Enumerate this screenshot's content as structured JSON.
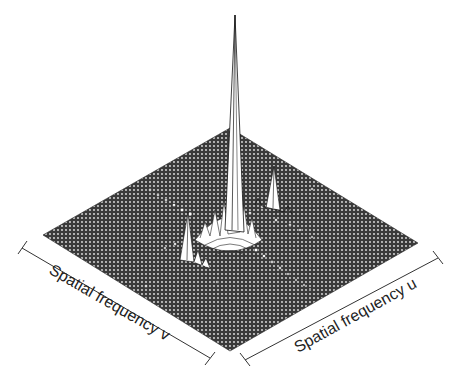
{
  "figure": {
    "type": "3D surface plot (2D Fourier amplitude spectrum)",
    "axes": {
      "v_label": "Spatial frequency v",
      "u_label": "Spatial frequency u"
    },
    "colors": {
      "background": "#ffffff",
      "surface": "#3a3a3a",
      "mesh_lines": "#f2f2f2",
      "axis": "#333333"
    },
    "features": {
      "central_peak": "tall narrow spike at origin",
      "secondary_peaks": [
        "left peak",
        "right peak"
      ],
      "diagonal_ridges": 2
    }
  }
}
